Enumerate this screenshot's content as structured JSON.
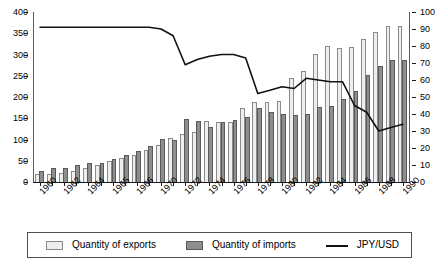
{
  "chart_data": {
    "type": "bar",
    "title": "",
    "subtitle": "",
    "xlabel": "",
    "ylabel": "",
    "y2label": "",
    "grid": false,
    "legend_position": "bottom",
    "x_tick_labels": [
      "1960",
      "1962",
      "1964",
      "1965",
      "1966",
      "1970",
      "1972",
      "1974",
      "1976",
      "1978",
      "1980",
      "1982",
      "1984",
      "1986",
      "1988",
      "1990"
    ],
    "x": [
      1960,
      1961,
      1962,
      1963,
      1964,
      1965,
      1966,
      1967,
      1968,
      1969,
      1970,
      1971,
      1972,
      1973,
      1974,
      1975,
      1976,
      1977,
      1978,
      1979,
      1980,
      1981,
      1982,
      1983,
      1984,
      1985,
      1986,
      1987,
      1988,
      1989,
      1990
    ],
    "ylim": [
      0,
      400
    ],
    "yticks": [
      0,
      50,
      100,
      150,
      200,
      250,
      300,
      350,
      400
    ],
    "y2lim": [
      0,
      100
    ],
    "y2ticks": [
      0,
      10,
      20,
      30,
      40,
      50,
      60,
      70,
      80,
      90,
      100
    ],
    "series": [
      {
        "name": "Quantity of exports",
        "axis": "left",
        "type": "bar",
        "color": "#eeeeee",
        "edge_color": "#8a8a8a",
        "values": [
          19,
          19,
          22,
          26,
          33,
          41,
          50,
          57,
          64,
          75,
          87,
          103,
          112,
          118,
          143,
          142,
          141,
          173,
          188,
          189,
          190,
          245,
          261,
          302,
          320,
          316,
          318,
          337,
          352,
          368,
          368
        ]
      },
      {
        "name": "Quantity of imports",
        "axis": "left",
        "type": "bar",
        "color": "#8e8e8e",
        "edge_color": "#5a5a5a",
        "values": [
          27,
          33,
          34,
          39,
          44,
          45,
          53,
          63,
          72,
          84,
          101,
          100,
          148,
          143,
          130,
          142,
          146,
          153,
          175,
          165,
          160,
          158,
          161,
          177,
          180,
          196,
          215,
          252,
          273,
          287,
          287
        ]
      },
      {
        "name": "JPY/USD",
        "axis": "right",
        "type": "line",
        "color": "#111111",
        "values": [
          91,
          91,
          91,
          91,
          91,
          91,
          91,
          91,
          91,
          91,
          90,
          86,
          69,
          72,
          74,
          75,
          75,
          73,
          52,
          54,
          56,
          55,
          61,
          60,
          59,
          59,
          45,
          41,
          30,
          32,
          34
        ]
      }
    ]
  },
  "legend": {
    "items": [
      {
        "label": "Quantity of exports",
        "marker": "light-square-swatch"
      },
      {
        "label": "Quantity of imports",
        "marker": "dark-square-swatch"
      },
      {
        "label": "JPY/USD",
        "marker": "line-swatch"
      }
    ]
  }
}
